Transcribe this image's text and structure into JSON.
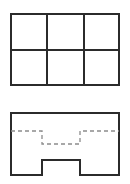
{
  "document": {
    "title": "Two orthographic views",
    "background_color": "#ffffff",
    "width": 130,
    "height": 184
  },
  "style": {
    "solid_line_color": "#2b2b2b",
    "solid_line_width": 2,
    "hidden_line_color": "#8c8c8c",
    "hidden_line_width": 1.3,
    "hidden_line_dash": "4 3"
  },
  "figures": [
    {
      "id": "top-view",
      "name": "grid-rectangle-view",
      "description": "Rectangle subdivided into a 3 by 2 grid of cells",
      "outline": {
        "x": 10,
        "y": 13,
        "width": 110,
        "height": 73
      },
      "grid": {
        "columns": 3,
        "rows": 2,
        "vertical_divider_x": [
          47,
          84
        ],
        "horizontal_divider_y": [
          50
        ]
      },
      "cells": [
        {
          "row": 1,
          "col": 1,
          "x": 10,
          "y": 13,
          "width": 37,
          "height": 37
        },
        {
          "row": 1,
          "col": 2,
          "x": 47,
          "y": 13,
          "width": 37,
          "height": 37
        },
        {
          "row": 1,
          "col": 3,
          "x": 84,
          "y": 13,
          "width": 36,
          "height": 37
        },
        {
          "row": 2,
          "col": 1,
          "x": 10,
          "y": 50,
          "width": 37,
          "height": 36
        },
        {
          "row": 2,
          "col": 2,
          "x": 47,
          "y": 50,
          "width": 37,
          "height": 36
        },
        {
          "row": 2,
          "col": 3,
          "x": 84,
          "y": 50,
          "width": 36,
          "height": 36
        }
      ]
    },
    {
      "id": "bottom-view",
      "name": "notched-rectangle-view",
      "description": "Rectangle with a rectangular notch cut into the bottom edge and a dashed hidden-edge profile inside",
      "outline_path": "M 10 112 L 120 112 L 120 176 L 80 176 L 80 160 L 42 160 L 42 176 L 10 176 Z",
      "outline": {
        "x": 10,
        "y": 112,
        "width": 110,
        "height": 64
      },
      "notch": {
        "left_x": 42,
        "right_x": 80,
        "top_y": 160,
        "bottom_y": 176,
        "width": 38,
        "depth": 16
      },
      "hidden_profile_path": "M 10 131 L 42 131 L 42 144 L 80 144 L 80 131 L 120 131",
      "hidden_profile": {
        "level_y": 131,
        "dip_left_x": 42,
        "dip_right_x": 80,
        "dip_bottom_y": 144,
        "dip_depth": 13
      }
    }
  ]
}
